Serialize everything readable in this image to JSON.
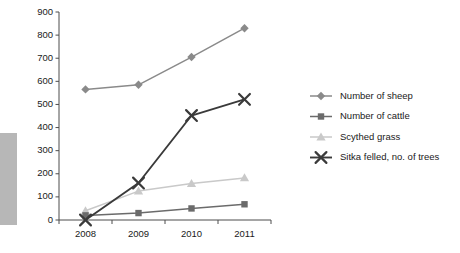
{
  "chart_data": {
    "type": "line",
    "title": "",
    "subtitle": "",
    "xlabel": "",
    "ylabel": "",
    "categories": [
      "2008",
      "2009",
      "2010",
      "2011"
    ],
    "x_tick_labels": [
      "2008",
      "2009",
      "2010",
      "2011"
    ],
    "y_tick_labels": [
      "0",
      "100",
      "200",
      "300",
      "400",
      "500",
      "600",
      "700",
      "800",
      "900"
    ],
    "y_ticks": [
      0,
      100,
      200,
      300,
      400,
      500,
      600,
      700,
      800,
      900
    ],
    "ylim": [
      0,
      900
    ],
    "grid": false,
    "legend_position": "right",
    "series": [
      {
        "name": "Number of sheep",
        "marker": "diamond",
        "color": "#8a8a8a",
        "values": [
          565,
          585,
          705,
          830
        ]
      },
      {
        "name": "Number of cattle",
        "marker": "square",
        "color": "#6b6b6b",
        "values": [
          20,
          30,
          50,
          68
        ]
      },
      {
        "name": "Scythed grass",
        "marker": "triangle",
        "color": "#c9c9c9",
        "values": [
          40,
          125,
          158,
          182
        ]
      },
      {
        "name": "Sitka felled, no. of trees",
        "marker": "cross-x",
        "color": "#3a3a3a",
        "values": [
          0,
          160,
          452,
          522
        ]
      }
    ]
  },
  "legend": {
    "items": [
      {
        "label": "Number of sheep",
        "marker": "diamond-marker-icon",
        "color": "#8a8a8a"
      },
      {
        "label": "Number of cattle",
        "marker": "square-marker-icon",
        "color": "#6b6b6b"
      },
      {
        "label": "Scythed grass",
        "marker": "triangle-marker-icon",
        "color": "#c9c9c9"
      },
      {
        "label": "Sitka felled, no. of trees",
        "marker": "x-marker-icon",
        "color": "#3a3a3a"
      }
    ]
  },
  "decor": {
    "side_bar_color": "#b7b7b7"
  }
}
